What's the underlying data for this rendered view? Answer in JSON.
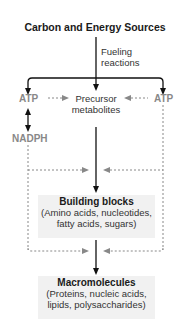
{
  "title": "Carbon and Energy Sources",
  "fueling_label_line1": "Fueling",
  "fueling_label_line2": "reactions",
  "atp_left": "ATP",
  "atp_right": "ATP",
  "precursor_line1": "Precursor",
  "precursor_line2": "metabolites",
  "nadph": "NADPH",
  "building_blocks": {
    "heading": "Building blocks",
    "line1": "(Amino acids, nucleotides,",
    "line2": "fatty acids, sugars)"
  },
  "macromolecules": {
    "heading": "Macromolecules",
    "line1": "(Proteins, nucleic acids,",
    "line2": "lipids, polysaccharides)"
  },
  "colors": {
    "solid_arrow": "#111111",
    "dashed_arrow": "#888888",
    "label_gray": "#888888",
    "box_fill": "#f1f1f1"
  }
}
